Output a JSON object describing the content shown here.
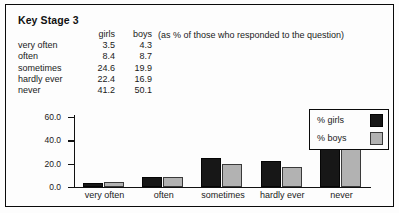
{
  "figure": {
    "title": "Key Stage 3",
    "note": "(as % of those who responded to the question)"
  },
  "table": {
    "headers": [
      "",
      "girls",
      "boys"
    ],
    "rows": [
      {
        "label": "very often",
        "girls": "3.5",
        "boys": "4.3"
      },
      {
        "label": "often",
        "girls": "8.4",
        "boys": "8.7"
      },
      {
        "label": "sometimes",
        "girls": "24.6",
        "boys": "19.9"
      },
      {
        "label": "hardly ever",
        "girls": "22.4",
        "boys": "16.9"
      },
      {
        "label": "never",
        "girls": "41.2",
        "boys": "50.1"
      }
    ]
  },
  "legend": {
    "items": [
      {
        "label": "% girls",
        "color": "#171717"
      },
      {
        "label": "% boys",
        "color": "#b2b2b2"
      }
    ]
  },
  "axis": {
    "y_ticks": [
      "60.0",
      "40.0",
      "20.0",
      "0.0"
    ]
  },
  "chart_data": {
    "type": "bar",
    "title": "Key Stage 3",
    "subtitle": "(as % of those who responded to the question)",
    "xlabel": "",
    "ylabel": "",
    "categories": [
      "very often",
      "often",
      "sometimes",
      "hardly ever",
      "never"
    ],
    "series": [
      {
        "name": "% girls",
        "color": "#171717",
        "values": [
          3.5,
          8.4,
          24.6,
          22.4,
          41.2
        ]
      },
      {
        "name": "% boys",
        "color": "#b2b2b2",
        "values": [
          4.3,
          8.7,
          19.9,
          16.9,
          50.1
        ]
      }
    ],
    "ylim": [
      0,
      60
    ],
    "ytick_values": [
      0,
      20,
      40,
      60
    ],
    "ytick_labels": [
      "0.0",
      "20.0",
      "40.0",
      "60.0"
    ],
    "grid": false,
    "legend_position": "top-right"
  }
}
